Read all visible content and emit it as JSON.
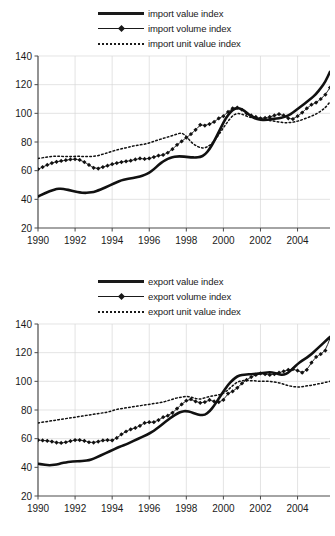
{
  "charts": [
    {
      "id": "import-chart",
      "legend": [
        {
          "label": "import value index",
          "style": "thick-solid"
        },
        {
          "label": "import volume index",
          "style": "thin-marker"
        },
        {
          "label": "import unit value index",
          "style": "dotted"
        }
      ]
    },
    {
      "id": "export-chart",
      "legend": [
        {
          "label": "export value index",
          "style": "thick-solid"
        },
        {
          "label": "export volume index",
          "style": "thin-marker"
        },
        {
          "label": "export unit value index",
          "style": "dotted"
        }
      ]
    }
  ],
  "chart_data": [
    {
      "type": "line",
      "title": "",
      "xlabel": "",
      "ylabel": "",
      "xlim": [
        1990,
        2005.75
      ],
      "ylim": [
        20,
        140
      ],
      "yticks": [
        20,
        40,
        60,
        80,
        100,
        120,
        140
      ],
      "xticks": [
        1990,
        1992,
        1994,
        1996,
        1998,
        2000,
        2002,
        2004
      ],
      "grid": true,
      "legend_position": "above-plot",
      "x": [
        1990.0,
        1990.25,
        1990.5,
        1990.75,
        1991.0,
        1991.25,
        1991.5,
        1991.75,
        1992.0,
        1992.25,
        1992.5,
        1992.75,
        1993.0,
        1993.25,
        1993.5,
        1993.75,
        1994.0,
        1994.25,
        1994.5,
        1994.75,
        1995.0,
        1995.25,
        1995.5,
        1995.75,
        1996.0,
        1996.25,
        1996.5,
        1996.75,
        1997.0,
        1997.25,
        1997.5,
        1997.75,
        1998.0,
        1998.25,
        1998.5,
        1998.75,
        1999.0,
        1999.25,
        1999.5,
        1999.75,
        2000.0,
        2000.25,
        2000.5,
        2000.75,
        2001.0,
        2001.25,
        2001.5,
        2001.75,
        2002.0,
        2002.25,
        2002.5,
        2002.75,
        2003.0,
        2003.25,
        2003.5,
        2003.75,
        2004.0,
        2004.25,
        2004.5,
        2004.75,
        2005.0,
        2005.25,
        2005.5,
        2005.75
      ],
      "series": [
        {
          "name": "import value index",
          "style": "thick-solid",
          "values": [
            42.0,
            43.5,
            45.0,
            46.3,
            47.2,
            47.5,
            47.0,
            46.2,
            45.4,
            44.8,
            44.5,
            44.6,
            45.2,
            46.2,
            47.5,
            49.0,
            50.5,
            52.0,
            53.2,
            54.0,
            54.6,
            55.2,
            56.0,
            57.0,
            58.5,
            61.0,
            64.0,
            66.5,
            68.3,
            69.4,
            70.0,
            70.0,
            69.6,
            69.3,
            69.2,
            69.5,
            71.0,
            75.0,
            80.5,
            87.0,
            93.5,
            99.0,
            102.5,
            103.8,
            103.0,
            100.5,
            98.0,
            96.2,
            95.5,
            95.4,
            95.7,
            96.2,
            96.5,
            97.2,
            98.5,
            100.5,
            103.0,
            105.5,
            108.0,
            110.5,
            113.5,
            117.5,
            122.0,
            129.0
          ]
        },
        {
          "name": "import volume index",
          "style": "thin-marker",
          "values": [
            61.0,
            62.5,
            64.0,
            65.3,
            66.2,
            66.8,
            67.3,
            67.8,
            68.0,
            67.5,
            66.0,
            64.0,
            62.0,
            61.5,
            62.5,
            63.5,
            64.5,
            65.3,
            66.0,
            66.5,
            67.0,
            67.8,
            68.5,
            68.2,
            68.5,
            69.5,
            70.5,
            71.0,
            72.5,
            75.0,
            78.0,
            80.5,
            83.0,
            85.5,
            88.5,
            92.0,
            91.5,
            92.5,
            94.0,
            96.5,
            98.0,
            101.0,
            103.5,
            104.0,
            102.5,
            100.0,
            98.5,
            97.5,
            96.5,
            96.8,
            97.5,
            98.5,
            99.5,
            98.5,
            96.5,
            96.0,
            98.0,
            100.5,
            103.5,
            106.0,
            107.5,
            110.0,
            113.0,
            118.0
          ]
        },
        {
          "name": "import unit value index",
          "style": "dotted",
          "values": [
            68.5,
            69.0,
            69.5,
            70.0,
            70.2,
            70.0,
            69.8,
            69.8,
            70.0,
            70.0,
            69.8,
            69.8,
            70.0,
            70.5,
            71.5,
            72.5,
            73.5,
            74.5,
            75.3,
            76.0,
            76.8,
            77.5,
            78.0,
            78.5,
            79.3,
            80.5,
            81.5,
            82.5,
            83.5,
            84.5,
            85.5,
            86.5,
            84.0,
            80.0,
            77.5,
            76.0,
            75.8,
            77.5,
            80.5,
            85.0,
            90.0,
            94.5,
            98.5,
            100.0,
            99.5,
            98.0,
            97.0,
            96.5,
            96.0,
            95.5,
            95.0,
            94.5,
            94.0,
            93.5,
            93.5,
            93.8,
            94.5,
            95.5,
            96.8,
            98.0,
            99.5,
            101.5,
            104.0,
            108.0
          ]
        }
      ]
    },
    {
      "type": "line",
      "title": "",
      "xlabel": "",
      "ylabel": "",
      "xlim": [
        1990,
        2005.75
      ],
      "ylim": [
        20,
        140
      ],
      "yticks": [
        20,
        40,
        60,
        80,
        100,
        120,
        140
      ],
      "xticks": [
        1990,
        1992,
        1994,
        1996,
        1998,
        2000,
        2002,
        2004
      ],
      "grid": true,
      "legend_position": "above-plot",
      "x": [
        1990.0,
        1990.25,
        1990.5,
        1990.75,
        1991.0,
        1991.25,
        1991.5,
        1991.75,
        1992.0,
        1992.25,
        1992.5,
        1992.75,
        1993.0,
        1993.25,
        1993.5,
        1993.75,
        1994.0,
        1994.25,
        1994.5,
        1994.75,
        1995.0,
        1995.25,
        1995.5,
        1995.75,
        1996.0,
        1996.25,
        1996.5,
        1996.75,
        1997.0,
        1997.25,
        1997.5,
        1997.75,
        1998.0,
        1998.25,
        1998.5,
        1998.75,
        1999.0,
        1999.25,
        1999.5,
        1999.75,
        2000.0,
        2000.25,
        2000.5,
        2000.75,
        2001.0,
        2001.25,
        2001.5,
        2001.75,
        2002.0,
        2002.25,
        2002.5,
        2002.75,
        2003.0,
        2003.25,
        2003.5,
        2003.75,
        2004.0,
        2004.25,
        2004.5,
        2004.75,
        2005.0,
        2005.25,
        2005.5,
        2005.75
      ],
      "series": [
        {
          "name": "export value index",
          "style": "thick-solid",
          "values": [
            42.5,
            42.0,
            41.5,
            41.5,
            42.0,
            42.8,
            43.5,
            44.0,
            44.2,
            44.3,
            44.5,
            45.0,
            46.0,
            47.5,
            49.0,
            50.5,
            52.0,
            53.5,
            54.8,
            56.0,
            57.5,
            59.0,
            60.5,
            62.0,
            63.5,
            65.5,
            68.0,
            70.5,
            73.0,
            75.5,
            77.5,
            79.0,
            79.3,
            78.5,
            77.3,
            76.5,
            76.5,
            79.0,
            83.0,
            88.0,
            93.0,
            97.5,
            101.0,
            103.5,
            104.5,
            104.8,
            105.0,
            105.3,
            105.5,
            106.0,
            106.3,
            106.0,
            104.8,
            104.5,
            106.0,
            109.0,
            112.0,
            114.5,
            116.5,
            119.0,
            122.0,
            125.0,
            128.0,
            131.0
          ]
        },
        {
          "name": "export volume index",
          "style": "thin-marker",
          "values": [
            59.0,
            58.8,
            58.5,
            58.0,
            57.3,
            57.0,
            57.5,
            58.3,
            59.0,
            59.0,
            58.5,
            57.5,
            57.3,
            58.0,
            58.8,
            59.0,
            58.8,
            60.5,
            63.0,
            65.0,
            66.5,
            67.5,
            69.0,
            71.0,
            71.5,
            71.5,
            73.0,
            75.0,
            76.0,
            78.0,
            81.0,
            84.0,
            86.5,
            87.5,
            86.0,
            85.0,
            85.5,
            87.0,
            86.0,
            85.5,
            87.0,
            91.5,
            93.0,
            95.5,
            98.5,
            101.0,
            103.0,
            104.5,
            105.5,
            105.0,
            104.5,
            105.0,
            106.0,
            107.0,
            108.0,
            108.5,
            107.5,
            106.0,
            108.0,
            113.0,
            117.0,
            119.0,
            121.5,
            130.0
          ]
        },
        {
          "name": "export unit value index",
          "style": "dotted",
          "values": [
            71.0,
            71.5,
            72.0,
            72.5,
            73.0,
            73.5,
            74.0,
            74.5,
            75.0,
            75.5,
            76.0,
            76.5,
            77.0,
            77.5,
            78.0,
            78.5,
            79.5,
            80.5,
            81.0,
            81.5,
            82.0,
            82.5,
            83.0,
            83.5,
            84.0,
            84.5,
            85.0,
            85.5,
            86.5,
            87.5,
            88.5,
            89.0,
            89.5,
            89.0,
            88.0,
            87.5,
            88.5,
            89.5,
            90.0,
            90.5,
            91.5,
            94.0,
            97.0,
            99.5,
            100.5,
            100.5,
            100.5,
            100.3,
            100.0,
            100.0,
            100.0,
            99.5,
            99.0,
            98.0,
            97.0,
            96.3,
            96.0,
            96.3,
            96.8,
            97.3,
            98.0,
            98.5,
            99.3,
            100.0
          ]
        }
      ]
    }
  ]
}
